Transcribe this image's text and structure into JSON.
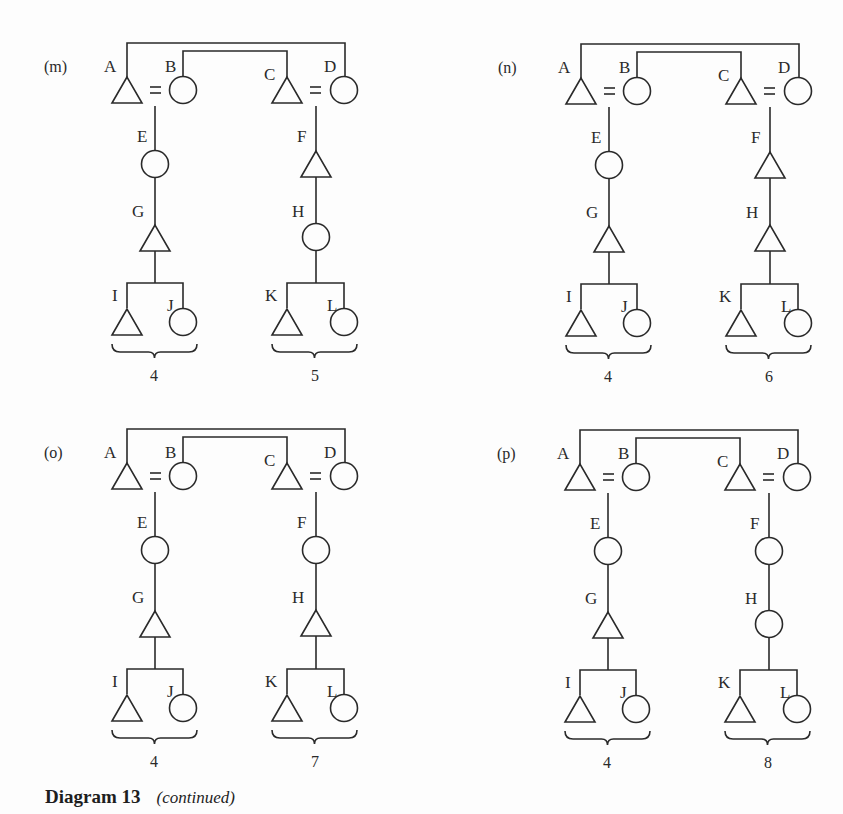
{
  "figure": {
    "caption_title": "Diagram 13",
    "caption_subtitle": "(continued)",
    "legend": {
      "triangle": "male",
      "circle": "female",
      "=": "marriage"
    },
    "panels": [
      {
        "id": "m",
        "label": "(m)",
        "offset": [
          0,
          0
        ],
        "nodes": {
          "A": "triangle",
          "B": "circle",
          "C": "triangle",
          "D": "circle",
          "E": "circle",
          "G": "triangle",
          "I": "triangle",
          "J": "circle",
          "F": "triangle",
          "H": "circle",
          "K": "triangle",
          "L": "circle"
        },
        "left_count": "4",
        "right_count": "5"
      },
      {
        "id": "n",
        "label": "(n)",
        "offset": [
          454,
          1
        ],
        "nodes": {
          "A": "triangle",
          "B": "circle",
          "C": "triangle",
          "D": "circle",
          "E": "circle",
          "G": "triangle",
          "I": "triangle",
          "J": "circle",
          "F": "triangle",
          "H": "triangle",
          "K": "triangle",
          "L": "circle"
        },
        "left_count": "4",
        "right_count": "6"
      },
      {
        "id": "o",
        "label": "(o)",
        "offset": [
          0,
          386
        ],
        "nodes": {
          "A": "triangle",
          "B": "circle",
          "C": "triangle",
          "D": "circle",
          "E": "circle",
          "G": "triangle",
          "I": "triangle",
          "J": "circle",
          "F": "circle",
          "H": "triangle",
          "K": "triangle",
          "L": "circle"
        },
        "left_count": "4",
        "right_count": "7"
      },
      {
        "id": "p",
        "label": "(p)",
        "offset": [
          453,
          387
        ],
        "nodes": {
          "A": "triangle",
          "B": "circle",
          "C": "triangle",
          "D": "circle",
          "E": "circle",
          "G": "triangle",
          "I": "triangle",
          "J": "circle",
          "F": "circle",
          "H": "circle",
          "K": "triangle",
          "L": "circle"
        },
        "left_count": "4",
        "right_count": "8"
      }
    ]
  },
  "colors": {
    "ink": "#2a2a2a",
    "background": "#fdfdfd"
  }
}
